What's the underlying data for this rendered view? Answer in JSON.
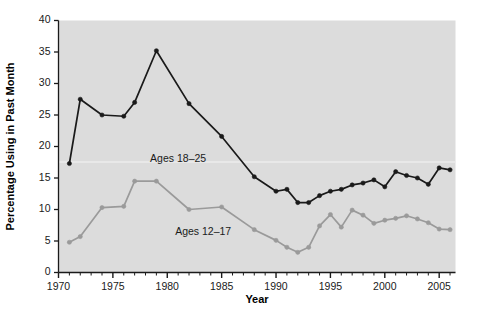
{
  "chart_data": {
    "type": "line",
    "title": "",
    "xlabel": "Year",
    "ylabel": "Percentage Using in Past Month",
    "xlim": [
      1970,
      2006.5
    ],
    "ylim": [
      0,
      40
    ],
    "yticks": [
      0,
      5,
      10,
      15,
      20,
      25,
      30,
      35,
      40
    ],
    "xticks": [
      1970,
      1975,
      1980,
      1985,
      1990,
      1995,
      2000,
      2005
    ],
    "xtick_labels": [
      "1970",
      "1975",
      "1980",
      "1985",
      "1990",
      "1995",
      "2000",
      "2005"
    ],
    "ytick_labels": [
      "0",
      "5",
      "10",
      "15",
      "20",
      "25",
      "30",
      "35",
      "40"
    ],
    "minor_xtick_interval": 1,
    "grid": false,
    "legend": "inline-annotations",
    "plot_background": "#dcdcdc",
    "figure_background": "#ffffff",
    "series": [
      {
        "name": "Ages 18-25",
        "label": "Ages 18–25",
        "color": "#1a1a1a",
        "marker": "circle",
        "x": [
          1971,
          1972,
          1974,
          1976,
          1977,
          1979,
          1982,
          1985,
          1988,
          1990,
          1991,
          1992,
          1993,
          1994,
          1995,
          1996,
          1997,
          1998,
          1999,
          2000,
          2001,
          2002,
          2003,
          2004,
          2005,
          2006
        ],
        "values": [
          17.3,
          27.5,
          25.0,
          24.8,
          27.0,
          35.2,
          26.8,
          21.6,
          15.2,
          12.9,
          13.2,
          11.1,
          11.1,
          12.2,
          12.9,
          13.2,
          13.9,
          14.2,
          14.7,
          13.6,
          16.0,
          15.4,
          15.0,
          14.0,
          16.6,
          16.3
        ]
      },
      {
        "name": "Ages 12-17",
        "label": "Ages 12–17",
        "color": "#9a9a9a",
        "marker": "circle",
        "x": [
          1971,
          1972,
          1974,
          1976,
          1977,
          1979,
          1982,
          1985,
          1988,
          1990,
          1991,
          1992,
          1993,
          1994,
          1995,
          1996,
          1997,
          1998,
          1999,
          2000,
          2001,
          2002,
          2003,
          2004,
          2005,
          2006
        ],
        "values": [
          4.8,
          5.7,
          10.3,
          10.5,
          14.5,
          14.5,
          10.0,
          10.4,
          6.8,
          5.1,
          4.0,
          3.2,
          4.0,
          7.4,
          9.2,
          7.2,
          9.9,
          9.1,
          7.8,
          8.3,
          8.6,
          9.0,
          8.5,
          7.9,
          6.9,
          6.8
        ]
      }
    ],
    "annotations": [
      {
        "text": "Ages 18–25",
        "x": 1981.0,
        "y": 17.6
      },
      {
        "text": "Ages 12–17",
        "x": 1983.3,
        "y": 6.0
      }
    ]
  }
}
